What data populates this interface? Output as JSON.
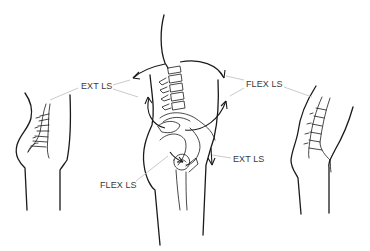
{
  "diagram": {
    "type": "anatomical illustration",
    "figures": [
      {
        "id": "left",
        "depicts": "side view of torso with lumbar spine in extension"
      },
      {
        "id": "center",
        "depicts": "lumbar spine, pelvis and femur with motion arrows"
      },
      {
        "id": "right",
        "depicts": "side view of torso with lumbar spine in flexion"
      }
    ],
    "labels": [
      {
        "id": "ext-ls-top",
        "text": "EXT LS"
      },
      {
        "id": "flex-ls-top",
        "text": "FLEX LS"
      },
      {
        "id": "flex-ls-bottom",
        "text": "FLEX LS"
      },
      {
        "id": "ext-ls-bottom",
        "text": "EXT LS"
      }
    ],
    "colors": {
      "ink": "#1a1a1a",
      "label_text": "#3a3a3a",
      "leader_lines": "#bdbdbd",
      "background": "#ffffff"
    }
  }
}
